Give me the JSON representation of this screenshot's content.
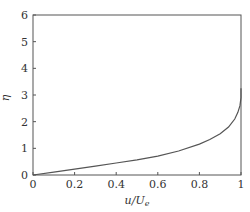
{
  "chart_data": {
    "type": "line",
    "title": "",
    "xlabel": "u/U_e",
    "xlabel_parts": {
      "main": "u/U",
      "sub": "e"
    },
    "ylabel": "η",
    "xlim": [
      0,
      1
    ],
    "ylim": [
      0,
      6
    ],
    "xticks": [
      0,
      0.2,
      0.4,
      0.6,
      0.8,
      1
    ],
    "xtick_labels": [
      "0",
      "0.2",
      "0.4",
      "0.6",
      "0.8",
      "1"
    ],
    "yticks": [
      0,
      1,
      2,
      3,
      4,
      5,
      6
    ],
    "ytick_labels": [
      "0",
      "1",
      "2",
      "3",
      "4",
      "5",
      "6"
    ],
    "grid": false,
    "legend": null,
    "series": [
      {
        "name": "velocity profile",
        "color": "#555555",
        "x": [
          0,
          0.1,
          0.2,
          0.3,
          0.4,
          0.5,
          0.6,
          0.7,
          0.8,
          0.85,
          0.9,
          0.94,
          0.97,
          0.985,
          0.995,
          1.0,
          1.0
        ],
        "y": [
          0,
          0.11,
          0.22,
          0.33,
          0.45,
          0.57,
          0.71,
          0.9,
          1.16,
          1.33,
          1.55,
          1.8,
          2.1,
          2.35,
          2.6,
          2.9,
          3.25
        ]
      }
    ]
  }
}
